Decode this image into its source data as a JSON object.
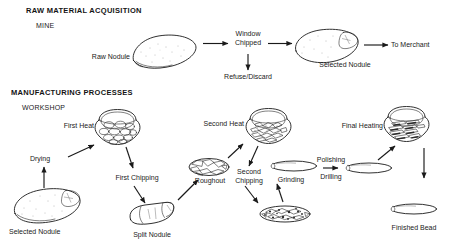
{
  "figure": {
    "sections": [
      {
        "id": "raw-material-acquisition",
        "title": "RAW MATERIAL ACQUISITION",
        "subtitle": "MINE"
      },
      {
        "id": "manufacturing-processes",
        "title": "MANUFACTURING PROCESSES",
        "subtitle": "WORKSHOP"
      }
    ],
    "mine_stage": {
      "raw_nodule_label": "Raw Nodule",
      "window_chipped_label": "Window\nChipped",
      "refuse_discard_label": "Refuse/Discard",
      "selected_nodule_label": "Selected Nodule",
      "to_merchant_label": "To Merchant"
    },
    "workshop_stage": {
      "selected_nodule_label": "Selected Nodule",
      "drying_label": "Drying",
      "first_heat_label": "First Heat",
      "first_chipping_label": "First Chipping",
      "split_nodule_label": "Split Nodule",
      "roughout_label": "Roughout",
      "second_heat_label": "Second Heat",
      "second_chipping_label": "Second\nChipping",
      "grinding_label": "Grinding",
      "polishing_label": "Polishing",
      "drilling_label": "Drilling",
      "final_heating_label": "Final Heating",
      "finished_bead_label": "Finished Bead"
    },
    "colors": {
      "ink": "#1a1a1a",
      "background": "#ffffff",
      "fill_dark": "#2a2a2a",
      "fill_mid": "#8c8c8c"
    }
  }
}
